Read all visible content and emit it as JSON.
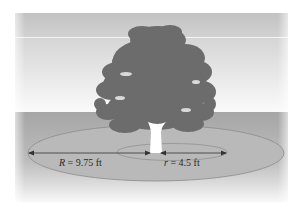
{
  "diagram": {
    "type": "illustration",
    "labels": {
      "outer_radius": {
        "symbol": "R",
        "equals": " = ",
        "value": "9.75",
        "unit": " ft"
      },
      "inner_radius": {
        "symbol": "r",
        "equals": " = ",
        "value": "4.5",
        "unit": " ft"
      }
    },
    "colors": {
      "sky_top": "#c4c4c4",
      "sky_bottom": "#fafafa",
      "horizon_line": "#f2f2f2",
      "ground": "#a9a9a9",
      "ground_fade": "#f4f4f4",
      "outer_ellipse_fill": "#b8b8b8",
      "outer_ellipse_stroke": "#8a8a8a",
      "inner_ellipse_stroke": "#8a8a8a",
      "tree_canopy": "#6e6e6e",
      "trunk": "#ffffff",
      "arrow": "#333333"
    }
  }
}
